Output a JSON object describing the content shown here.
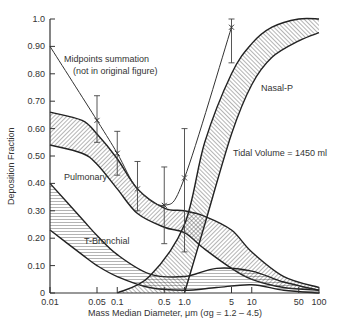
{
  "chart_data": {
    "type": "line",
    "title": "",
    "xlabel": "Mass Median Diameter,  μm (σg = 1.2 – 4.5)",
    "ylabel": "Deposition Fraction",
    "xscale": "log",
    "xlim": [
      0.01,
      100
    ],
    "ylim": [
      0,
      1.0
    ],
    "x_ticks": [
      "0.01",
      "0.05",
      "0.1",
      "0.5",
      "1.0",
      "5",
      "10",
      "50",
      "100"
    ],
    "y_ticks": [
      "0",
      "0.10",
      "0.20",
      "0.30",
      "0.40",
      "0.50",
      "0.60",
      "0.70",
      "0.80",
      "0.90",
      "1.0"
    ],
    "grid": false,
    "annotations": [
      "Midpoints summation",
      "(not in original figure)",
      "Tidal Volume = 1450 ml"
    ],
    "bands": [
      {
        "name": "Pulmonary",
        "hatch": "diagonal",
        "upper": {
          "x": [
            0.01,
            0.03,
            0.05,
            0.1,
            0.2,
            0.5,
            1.0,
            2,
            5,
            10,
            30,
            100
          ],
          "y": [
            0.66,
            0.63,
            0.58,
            0.49,
            0.38,
            0.31,
            0.3,
            0.28,
            0.23,
            0.15,
            0.06,
            0.02
          ]
        },
        "lower": {
          "x": [
            0.01,
            0.03,
            0.05,
            0.1,
            0.2,
            0.5,
            1.0,
            2,
            5,
            10,
            30,
            100
          ],
          "y": [
            0.54,
            0.51,
            0.47,
            0.38,
            0.29,
            0.24,
            0.22,
            0.16,
            0.09,
            0.05,
            0.02,
            0.01
          ]
        }
      },
      {
        "name": "T-Bronchial",
        "hatch": "horizontal",
        "upper": {
          "x": [
            0.01,
            0.03,
            0.05,
            0.1,
            0.3,
            1.0,
            3,
            10,
            30,
            100
          ],
          "y": [
            0.4,
            0.27,
            0.21,
            0.14,
            0.07,
            0.06,
            0.09,
            0.08,
            0.04,
            0.01
          ]
        },
        "lower": {
          "x": [
            0.01,
            0.03,
            0.05,
            0.1,
            0.3,
            1.0,
            3,
            10,
            30,
            100
          ],
          "y": [
            0.23,
            0.14,
            0.1,
            0.06,
            0.02,
            0.01,
            0.02,
            0.03,
            0.01,
            0.0
          ]
        }
      },
      {
        "name": "Nasal-P",
        "hatch": "diagonal",
        "upper": {
          "x": [
            0.1,
            0.3,
            1.0,
            2,
            5,
            10,
            20,
            50,
            100
          ],
          "y": [
            0.0,
            0.06,
            0.25,
            0.55,
            0.8,
            0.91,
            0.97,
            1.0,
            1.0
          ]
        },
        "lower": {
          "x": [
            1.0,
            2,
            5,
            10,
            20,
            50,
            100
          ],
          "y": [
            0.0,
            0.25,
            0.58,
            0.76,
            0.86,
            0.92,
            0.95
          ]
        }
      }
    ],
    "series": [
      {
        "name": "Midpoints summation",
        "x": [
          0.01,
          0.05,
          0.1,
          0.2,
          0.5,
          1.0,
          5
        ],
        "y": [
          0.9,
          0.63,
          0.51,
          0.38,
          0.32,
          0.42,
          0.97
        ],
        "error_low": [
          null,
          0.55,
          0.43,
          0.3,
          0.18,
          0.15,
          0.84
        ],
        "error_high": [
          null,
          0.72,
          0.59,
          0.48,
          0.46,
          0.6,
          1.0
        ]
      }
    ],
    "labels": {
      "pulmonary": "Pulmonary",
      "t_bronchial": "T-Bronchial",
      "nasal_p": "Nasal-P"
    }
  }
}
